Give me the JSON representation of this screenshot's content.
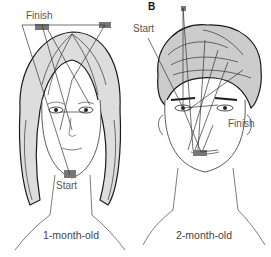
{
  "figure": {
    "panel_a": {
      "start_label": "Start",
      "finish_label": "Finish",
      "caption": "1-month-old"
    },
    "panel_b": {
      "letter": "B",
      "start_label": "Start",
      "finish_label": "Finish",
      "caption": "2-month-old"
    },
    "colors": {
      "line": "#333333",
      "hair": "#1a1a1a",
      "text": "#555555",
      "fixation": "#777777"
    }
  }
}
